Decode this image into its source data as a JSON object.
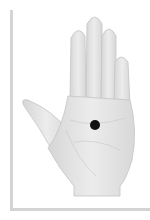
{
  "image": {
    "subject": "palm-of-hand-illustration",
    "caption_partial": "",
    "marker": {
      "type": "acupoint-dot",
      "color": "#111111",
      "cx": 95,
      "cy": 125
    }
  },
  "colors": {
    "skin": "#e6e6e6",
    "skin_shadow": "#cfcfcf",
    "frame": "#d4d4d4"
  }
}
